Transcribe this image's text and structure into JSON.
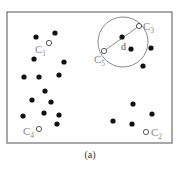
{
  "figure": {
    "caption": "(a)",
    "frame": {
      "x": 7,
      "y": 12,
      "width": 165,
      "height": 131,
      "stroke": "#6e6e6e"
    },
    "colors": {
      "point": "#111111",
      "centroid_stroke": "#555555",
      "label": "#8a8a8a",
      "circle": "#8a8a8a"
    },
    "points": [
      {
        "x": 36,
        "y": 37
      },
      {
        "x": 55,
        "y": 33
      },
      {
        "x": 34,
        "y": 59
      },
      {
        "x": 64,
        "y": 62
      },
      {
        "x": 24,
        "y": 77
      },
      {
        "x": 39,
        "y": 77
      },
      {
        "x": 59,
        "y": 75
      },
      {
        "x": 45,
        "y": 91
      },
      {
        "x": 32,
        "y": 100
      },
      {
        "x": 51,
        "y": 102
      },
      {
        "x": 23,
        "y": 116
      },
      {
        "x": 44,
        "y": 113
      },
      {
        "x": 59,
        "y": 115
      },
      {
        "x": 57,
        "y": 124
      },
      {
        "x": 122,
        "y": 37
      },
      {
        "x": 131,
        "y": 49
      },
      {
        "x": 151,
        "y": 48
      },
      {
        "x": 143,
        "y": 66
      },
      {
        "x": 133,
        "y": 104
      },
      {
        "x": 152,
        "y": 114
      },
      {
        "x": 113,
        "y": 121
      },
      {
        "x": 132,
        "y": 124
      }
    ],
    "centroids": [
      {
        "id": "C1",
        "letter": "C",
        "sub": "1",
        "x": 49,
        "y": 43,
        "label_x": 35,
        "label_y": 53
      },
      {
        "id": "C2",
        "letter": "C",
        "sub": "2",
        "x": 146,
        "y": 132,
        "label_x": 151,
        "label_y": 136
      },
      {
        "id": "C3",
        "letter": "C",
        "sub": "3",
        "x": 139,
        "y": 26,
        "label_x": 143,
        "label_y": 30
      },
      {
        "id": "C4",
        "letter": "C",
        "sub": "4",
        "x": 39,
        "y": 129,
        "label_x": 23,
        "label_y": 135
      },
      {
        "id": "C5",
        "letter": "C",
        "sub": "5",
        "x": 104,
        "y": 51,
        "label_x": 94,
        "label_y": 63
      }
    ],
    "circle": {
      "cx": 123,
      "cy": 42,
      "r": 25
    },
    "distance_line": {
      "x1": 104,
      "y1": 51,
      "x2": 139,
      "y2": 26,
      "label": "d",
      "label_x": 121,
      "label_y": 50
    }
  }
}
